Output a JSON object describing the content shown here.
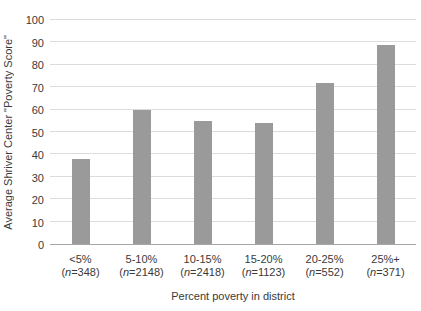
{
  "figure": {
    "background_color": "#ffffff",
    "bar_color": "#9a9a9a",
    "gridline_color": "#dcdcdc",
    "axis_line_color": "#a6a6a6",
    "text_color": "#3a3a3a"
  },
  "chart_data": {
    "type": "bar",
    "title": "",
    "categories": [
      "<5%",
      "5-10%",
      "10-15%",
      "15-20%",
      "20-25%",
      "25%+"
    ],
    "counts": [
      348,
      2148,
      2418,
      1123,
      552,
      371
    ],
    "count_labels": [
      "(n=348)",
      "(n=2148)",
      "(n=2418)",
      "(n=1123)",
      "(n=552)",
      "(n=371)"
    ],
    "values": [
      38,
      60,
      55,
      54,
      72,
      89
    ],
    "xlabel": "Percent poverty in district",
    "ylabel": "Average Shriver Center \"Poverty Score\"",
    "ylim": [
      0,
      100
    ],
    "yticks": [
      0,
      10,
      20,
      30,
      40,
      50,
      60,
      70,
      80,
      90,
      100
    ],
    "grid": "horizontal",
    "legend": "none"
  }
}
